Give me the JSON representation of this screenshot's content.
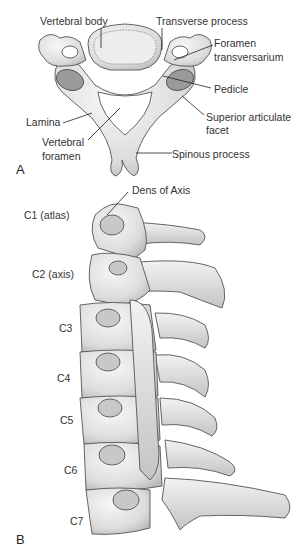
{
  "figure": {
    "panel_a": {
      "letter": "A",
      "title": "Superior view of a cervical vertebra",
      "labels": {
        "vertebral_body": "Vertebral body",
        "transverse_process": "Transverse process",
        "foramen_transversarium_1": "Foramen",
        "foramen_transversarium_2": "transversarium",
        "pedicle": "Pedicle",
        "superior_articulate_facet_1": "Superior articulate",
        "superior_articulate_facet_2": "facet",
        "lamina": "Lamina",
        "vertebral_foramen_1": "Vertebral",
        "vertebral_foramen_2": "foramen",
        "spinous_process": "Spinous process"
      }
    },
    "panel_b": {
      "letter": "B",
      "title": "Lateral view of the cervical spine",
      "labels": {
        "dens": "Dens of Axis",
        "c1": "C1 (atlas)",
        "c2": "C2 (axis)",
        "c3": "C3",
        "c4": "C4",
        "c5": "C5",
        "c6": "C6",
        "c7": "C7"
      }
    },
    "colors": {
      "bone_fill": "#e6e6e6",
      "bone_shade": "#bdbdbd",
      "outline": "#555555",
      "facet": "#9a9a9a",
      "leader": "#222222"
    }
  }
}
